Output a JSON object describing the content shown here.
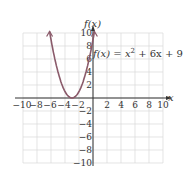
{
  "chart_data": {
    "type": "line",
    "title": "",
    "function_label": "f(x) = x² + 6x + 9",
    "xlabel": "x",
    "ylabel": "f(x)",
    "xlim": [
      -10,
      10
    ],
    "ylim": [
      -10,
      10
    ],
    "grid": true,
    "x_ticks": [
      -10,
      -8,
      -6,
      -4,
      -2,
      2,
      4,
      6,
      8,
      10
    ],
    "y_ticks": [
      -10,
      -8,
      -6,
      -4,
      -2,
      2,
      4,
      6,
      8,
      10
    ],
    "series": [
      {
        "name": "f(x) = x^2 + 6x + 9",
        "x": [
          -6.2,
          -6,
          -5,
          -4,
          -3,
          -2,
          -1,
          0,
          0.2
        ],
        "y": [
          10.24,
          9,
          4,
          1,
          0,
          1,
          4,
          9,
          10.24
        ]
      }
    ],
    "vertex": [
      -3,
      0
    ],
    "colors": {
      "curve": "#8a5a6a",
      "grid": "#d8d8d8",
      "axis": "#333333"
    }
  },
  "labels": {
    "y_axis": "f(x)",
    "x_axis": "x",
    "equation_lhs": "f(x) = x",
    "equation_exp": "2",
    "equation_rhs": " + 6x + 9"
  }
}
